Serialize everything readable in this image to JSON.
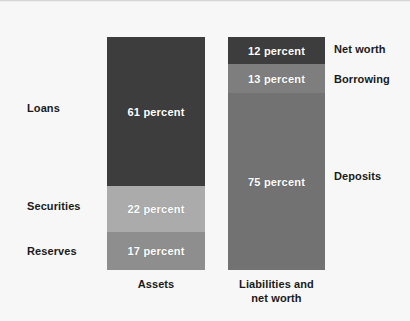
{
  "chart_data": {
    "type": "bar",
    "title": "",
    "subtitle": "",
    "xlabel": "",
    "ylabel": "",
    "stacked": true,
    "normalized_percent": true,
    "grid": false,
    "legend_position": "inline-side-labels",
    "ylim": [
      0,
      100
    ],
    "categories": [
      "Assets",
      "Liabilities and net worth"
    ],
    "series": [
      {
        "name": "Loans",
        "category": "Assets",
        "value": 61,
        "value_label": "61 percent",
        "side_label": "Loans",
        "side": "left",
        "color": "#3d3d3d"
      },
      {
        "name": "Securities",
        "category": "Assets",
        "value": 22,
        "value_label": "22 percent",
        "side_label": "Securities",
        "side": "left",
        "color": "#ababab"
      },
      {
        "name": "Reserves",
        "category": "Assets",
        "value": 17,
        "value_label": "17 percent",
        "side_label": "Reserves",
        "side": "left",
        "color": "#8e8e8e"
      },
      {
        "name": "Net worth",
        "category": "Liabilities and net worth",
        "value": 12,
        "value_label": "12 percent",
        "side_label": "Net worth",
        "side": "right",
        "color": "#3d3d3d"
      },
      {
        "name": "Borrowing",
        "category": "Liabilities and net worth",
        "value": 13,
        "value_label": "13 percent",
        "side_label": "Borrowing",
        "side": "right",
        "color": "#7e7e7e"
      },
      {
        "name": "Deposits",
        "category": "Liabilities and net worth",
        "value": 75,
        "value_label": "75 percent",
        "side_label": "Deposits",
        "side": "right",
        "color": "#727272"
      }
    ]
  },
  "bars": {
    "assets": {
      "caption": "Assets",
      "segments": {
        "loans": {
          "value_label": "61 percent",
          "side_label": "Loans"
        },
        "securities": {
          "value_label": "22 percent",
          "side_label": "Securities"
        },
        "reserves": {
          "value_label": "17 percent",
          "side_label": "Reserves"
        }
      }
    },
    "liabilities": {
      "caption_line1": "Liabilities and",
      "caption_line2": "net worth",
      "segments": {
        "net_worth": {
          "value_label": "12 percent",
          "side_label": "Net worth"
        },
        "borrowing": {
          "value_label": "13 percent",
          "side_label": "Borrowing"
        },
        "deposits": {
          "value_label": "75 percent",
          "side_label": "Deposits"
        }
      }
    }
  },
  "colors": {
    "background": "#f7f7f7",
    "dark_segment": "#3d3d3d",
    "light_segment": "#ababab",
    "medium_segment": "#8e8e8e",
    "borrowing_segment": "#7e7e7e",
    "deposits_segment": "#727272",
    "text": "#1a1a1a",
    "value_text": "#ffffff"
  }
}
